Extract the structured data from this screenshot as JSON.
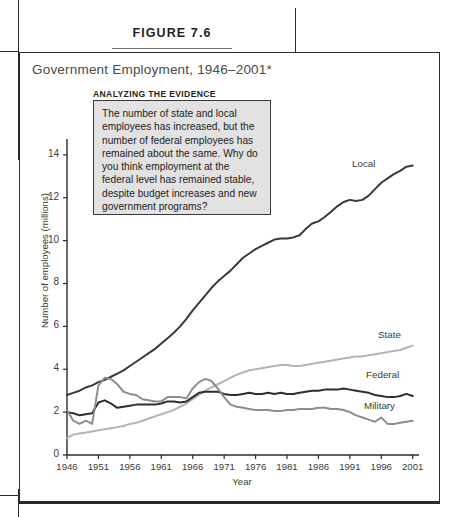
{
  "page": {
    "figure_label": "FIGURE 7.6"
  },
  "callout": {
    "header": "ANALYZING THE EVIDENCE",
    "body": "The number of state and local employees has increased, but the number of federal employees has remained about the same. Why do you think employment at the federal level has remained stable, despite budget increases and new government programs?"
  },
  "chart_data": {
    "type": "line",
    "title": "Government Employment, 1946–2001*",
    "xlabel": "Year",
    "ylabel": "Number of employees (millions)",
    "xlim": [
      1946,
      2002
    ],
    "ylim": [
      0,
      14.6
    ],
    "yticks": [
      0,
      2,
      4,
      6,
      8,
      10,
      12,
      14
    ],
    "xticks": [
      1946,
      1951,
      1956,
      1961,
      1966,
      1971,
      1976,
      1981,
      1986,
      1991,
      1996,
      2001
    ],
    "grid": false,
    "legend": "inline-right-labels",
    "colors": {
      "local": "#3a3a3a",
      "state": "#b4b4b4",
      "federal": "#2e2e2e",
      "military": "#8d8d8d"
    },
    "series": [
      {
        "name": "Local",
        "color_key": "local",
        "x": [
          1946,
          1947,
          1948,
          1949,
          1950,
          1951,
          1952,
          1953,
          1954,
          1955,
          1956,
          1957,
          1958,
          1959,
          1960,
          1961,
          1962,
          1963,
          1964,
          1965,
          1966,
          1967,
          1968,
          1969,
          1970,
          1971,
          1972,
          1973,
          1974,
          1975,
          1976,
          1977,
          1978,
          1979,
          1980,
          1981,
          1982,
          1983,
          1984,
          1985,
          1986,
          1987,
          1988,
          1989,
          1990,
          1991,
          1992,
          1993,
          1994,
          1995,
          1996,
          1997,
          1998,
          1999,
          2000,
          2001
        ],
        "values": [
          2.8,
          2.9,
          3.0,
          3.15,
          3.25,
          3.4,
          3.5,
          3.65,
          3.8,
          3.95,
          4.15,
          4.35,
          4.55,
          4.75,
          4.95,
          5.2,
          5.45,
          5.7,
          6.0,
          6.35,
          6.75,
          7.1,
          7.45,
          7.8,
          8.1,
          8.35,
          8.6,
          8.9,
          9.2,
          9.4,
          9.6,
          9.75,
          9.9,
          10.05,
          10.1,
          10.1,
          10.15,
          10.25,
          10.55,
          10.8,
          10.9,
          11.1,
          11.35,
          11.6,
          11.8,
          11.9,
          11.85,
          11.9,
          12.1,
          12.4,
          12.7,
          12.9,
          13.1,
          13.25,
          13.45,
          13.5
        ]
      },
      {
        "name": "State",
        "color_key": "state",
        "x": [
          1946,
          1947,
          1948,
          1949,
          1950,
          1951,
          1952,
          1953,
          1954,
          1955,
          1956,
          1957,
          1958,
          1959,
          1960,
          1961,
          1962,
          1963,
          1964,
          1965,
          1966,
          1967,
          1968,
          1969,
          1970,
          1971,
          1972,
          1973,
          1974,
          1975,
          1976,
          1977,
          1978,
          1979,
          1980,
          1981,
          1982,
          1983,
          1984,
          1985,
          1986,
          1987,
          1988,
          1989,
          1990,
          1991,
          1992,
          1993,
          1994,
          1995,
          1996,
          1997,
          1998,
          1999,
          2000,
          2001
        ],
        "values": [
          0.8,
          0.95,
          1.0,
          1.05,
          1.1,
          1.15,
          1.2,
          1.25,
          1.3,
          1.35,
          1.45,
          1.5,
          1.6,
          1.7,
          1.8,
          1.9,
          2.0,
          2.1,
          2.25,
          2.4,
          2.6,
          2.8,
          3.0,
          3.15,
          3.3,
          3.45,
          3.6,
          3.75,
          3.85,
          3.95,
          4.0,
          4.05,
          4.1,
          4.15,
          4.2,
          4.2,
          4.15,
          4.15,
          4.2,
          4.25,
          4.3,
          4.35,
          4.4,
          4.45,
          4.5,
          4.55,
          4.6,
          4.6,
          4.65,
          4.7,
          4.75,
          4.8,
          4.85,
          4.9,
          5.0,
          5.1
        ]
      },
      {
        "name": "Federal",
        "color_key": "federal",
        "x": [
          1946,
          1947,
          1948,
          1949,
          1950,
          1951,
          1952,
          1953,
          1954,
          1955,
          1956,
          1957,
          1958,
          1959,
          1960,
          1961,
          1962,
          1963,
          1964,
          1965,
          1966,
          1967,
          1968,
          1969,
          1970,
          1971,
          1972,
          1973,
          1974,
          1975,
          1976,
          1977,
          1978,
          1979,
          1980,
          1981,
          1982,
          1983,
          1984,
          1985,
          1986,
          1987,
          1988,
          1989,
          1990,
          1991,
          1992,
          1993,
          1994,
          1995,
          1996,
          1997,
          1998,
          1999,
          2000,
          2001
        ],
        "values": [
          2.0,
          1.95,
          1.85,
          1.9,
          1.95,
          2.45,
          2.55,
          2.4,
          2.2,
          2.25,
          2.3,
          2.35,
          2.35,
          2.35,
          2.35,
          2.4,
          2.5,
          2.5,
          2.45,
          2.5,
          2.7,
          2.9,
          2.95,
          2.95,
          2.95,
          2.85,
          2.8,
          2.8,
          2.85,
          2.9,
          2.85,
          2.85,
          2.9,
          2.85,
          2.9,
          2.85,
          2.85,
          2.9,
          2.95,
          3.0,
          3.0,
          3.05,
          3.05,
          3.05,
          3.1,
          3.05,
          3.0,
          2.95,
          2.9,
          2.8,
          2.75,
          2.7,
          2.7,
          2.75,
          2.85,
          2.75
        ]
      },
      {
        "name": "Military",
        "color_key": "military",
        "x": [
          1946,
          1947,
          1948,
          1949,
          1950,
          1951,
          1952,
          1953,
          1954,
          1955,
          1956,
          1957,
          1958,
          1959,
          1960,
          1961,
          1962,
          1963,
          1964,
          1965,
          1966,
          1967,
          1968,
          1969,
          1970,
          1971,
          1972,
          1973,
          1974,
          1975,
          1976,
          1977,
          1978,
          1979,
          1980,
          1981,
          1982,
          1983,
          1984,
          1985,
          1986,
          1987,
          1988,
          1989,
          1990,
          1991,
          1992,
          1993,
          1994,
          1995,
          1996,
          1997,
          1998,
          1999,
          2000,
          2001
        ],
        "values": [
          2.1,
          1.6,
          1.45,
          1.6,
          1.45,
          3.25,
          3.6,
          3.55,
          3.3,
          2.95,
          2.85,
          2.8,
          2.6,
          2.55,
          2.5,
          2.5,
          2.7,
          2.7,
          2.7,
          2.65,
          3.1,
          3.4,
          3.55,
          3.45,
          3.1,
          2.7,
          2.35,
          2.25,
          2.2,
          2.15,
          2.1,
          2.1,
          2.1,
          2.05,
          2.05,
          2.1,
          2.1,
          2.15,
          2.15,
          2.15,
          2.2,
          2.2,
          2.15,
          2.15,
          2.1,
          2.0,
          1.85,
          1.75,
          1.65,
          1.55,
          1.75,
          1.45,
          1.45,
          1.5,
          1.55,
          1.6
        ]
      }
    ]
  }
}
